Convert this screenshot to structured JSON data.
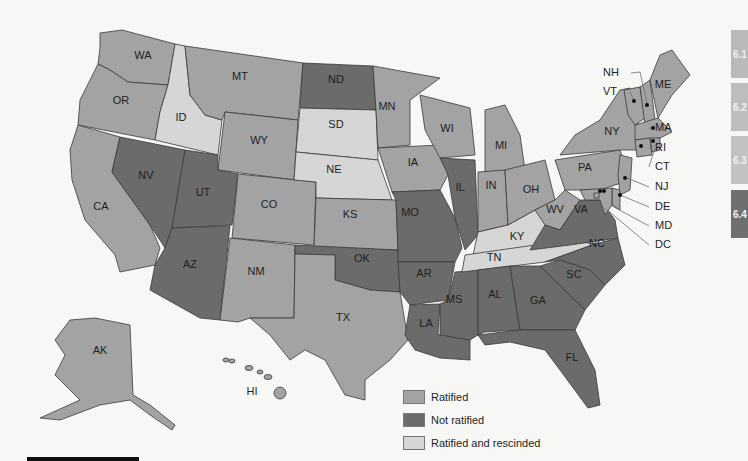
{
  "map": {
    "title": "",
    "colors": {
      "ratified": "#a3a3a3",
      "not_ratified": "#6b6b6b",
      "rescinded": "#d6d6d6"
    },
    "legend": [
      {
        "key": "ratified",
        "label": "Ratified"
      },
      {
        "key": "not_ratified",
        "label": "Not ratified"
      },
      {
        "key": "rescinded",
        "label": "Ratified and rescinded"
      }
    ],
    "states": {
      "WA": "ratified",
      "OR": "ratified",
      "CA": "ratified",
      "ID": "rescinded",
      "NV": "not_ratified",
      "MT": "ratified",
      "WY": "ratified",
      "UT": "not_ratified",
      "AZ": "not_ratified",
      "CO": "ratified",
      "NM": "ratified",
      "ND": "not_ratified",
      "SD": "rescinded",
      "NE": "rescinded",
      "KS": "ratified",
      "OK": "not_ratified",
      "TX": "ratified",
      "MN": "ratified",
      "IA": "ratified",
      "MO": "not_ratified",
      "AR": "not_ratified",
      "LA": "not_ratified",
      "WI": "ratified",
      "IL": "not_ratified",
      "MS": "not_ratified",
      "MI": "ratified",
      "IN": "ratified",
      "KY": "rescinded",
      "TN": "rescinded",
      "AL": "not_ratified",
      "OH": "ratified",
      "WV": "ratified",
      "VA": "not_ratified",
      "NC": "not_ratified",
      "SC": "not_ratified",
      "GA": "not_ratified",
      "FL": "not_ratified",
      "PA": "ratified",
      "NY": "ratified",
      "ME": "ratified",
      "VT": "ratified",
      "NH": "ratified",
      "MA": "ratified",
      "RI": "ratified",
      "CT": "ratified",
      "NJ": "ratified",
      "DE": "ratified",
      "MD": "ratified",
      "DC": "ratified",
      "AK": "ratified",
      "HI": "ratified"
    },
    "callouts": [
      "NH",
      "VT",
      "MA",
      "RI",
      "CT",
      "NJ",
      "DE",
      "MD",
      "DC"
    ]
  },
  "side_tabs": [
    {
      "label": "6.1",
      "active": false
    },
    {
      "label": "6.2",
      "active": false
    },
    {
      "label": "6.3",
      "active": false
    },
    {
      "label": "6.4",
      "active": true
    }
  ]
}
